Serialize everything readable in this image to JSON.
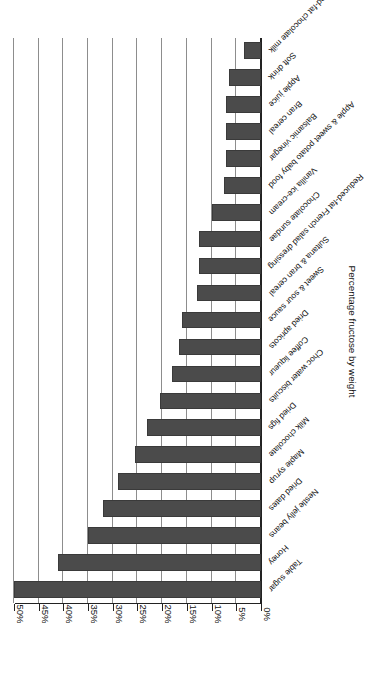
{
  "chart_data": {
    "type": "bar",
    "orientation": "horizontal",
    "title": "",
    "xlabel": "Percentage fructose by weight",
    "ylabel": "",
    "xlim": [
      0,
      50
    ],
    "grid": true,
    "legend": "none",
    "bar_color": "#4b4b4b",
    "tick_labels": [
      "0%",
      "5%",
      "10%",
      "15%",
      "20%",
      "25%",
      "30%",
      "35%",
      "40%",
      "45%",
      "50%"
    ],
    "tick_values": [
      0,
      5,
      10,
      15,
      20,
      25,
      30,
      35,
      40,
      45,
      50
    ],
    "categories": [
      "Table sugar",
      "Honey",
      "Nestle jelly beans",
      "Dried dates",
      "Maple syrup",
      "Milk chocolate",
      "Dried figs",
      "Choc water biscuits",
      "Coffee liqueur",
      "Dried apricots",
      "Sweet & sour sauce",
      "Sultana & bran cereal",
      "Reduced-fat French salad dressing",
      "Chocolate sundae",
      "Vanilla ice-cream",
      "Apple & sweet potato baby food",
      "Balsamic vinegar",
      "Bran cereal",
      "Apple juice",
      "Soft drink",
      "Reduced-fat chocolate milk"
    ],
    "values": [
      50,
      41,
      35,
      32,
      29,
      25.5,
      23,
      20.5,
      18,
      16.5,
      16,
      13,
      12.5,
      12.5,
      10,
      7.5,
      7,
      7,
      7,
      6.5,
      3.5
    ]
  }
}
